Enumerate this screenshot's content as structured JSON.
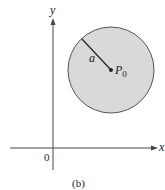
{
  "figure": {
    "caption": "(b)",
    "axes": {
      "x_label": "x",
      "y_label": "y",
      "origin_label": "0"
    },
    "circle": {
      "center_label": "P",
      "center_subscript": "0",
      "radius_label": "a",
      "fill": "#d9d9d9",
      "stroke": "#555555"
    }
  }
}
